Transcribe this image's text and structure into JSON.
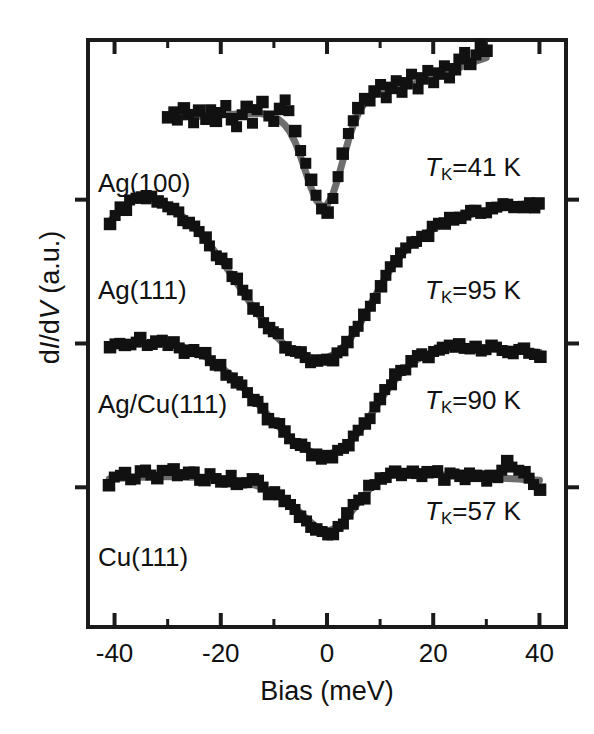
{
  "figure": {
    "background": "#ffffff",
    "frame_color": "#1a1a1a",
    "data_color": "#111111",
    "fit_color": "#6e6e6e"
  },
  "axes": {
    "xlabel": "Bias (meV)",
    "ylabel_prefix": "d",
    "ylabel_I": "I",
    "ylabel_mid": "/d",
    "ylabel_V": "V",
    "ylabel_suffix": " (a.u.)",
    "ylabel_full": "dI/dV (a.u.)",
    "xlim": [
      -45,
      45
    ],
    "ylim": [
      0,
      1
    ],
    "xticks_major": [
      -40,
      -20,
      0,
      20,
      40
    ],
    "xticks_major_labels": [
      "-40",
      "-20",
      "0",
      "20",
      "40"
    ],
    "xticks_minor": [
      -30,
      -10,
      10,
      30
    ],
    "yticks_unlabeled_count": 3,
    "grid": false
  },
  "chart_data": {
    "type": "line",
    "title": "",
    "xlabel": "Bias (meV)",
    "ylabel": "dI/dV (a.u.)",
    "xlim": [
      -45,
      45
    ],
    "ylim": [
      0,
      1
    ],
    "legend_position": "inline-labels",
    "series": [
      {
        "name": "Ag(100)",
        "label": "Ag(100)",
        "kondo_temperature_K": 41,
        "annotation": "TK=41 K",
        "x": [
          -30,
          -29,
          -28,
          -27,
          -26,
          -25,
          -24,
          -23,
          -22,
          -21,
          -20,
          -19,
          -18,
          -17,
          -16,
          -15,
          -14,
          -13,
          -12,
          -11,
          -10,
          -9,
          -8,
          -7,
          -6,
          -5,
          -4,
          -3,
          -2,
          -1,
          0,
          1,
          2,
          3,
          4,
          5,
          6,
          7,
          8,
          9,
          10,
          11,
          12,
          13,
          14,
          15,
          16,
          17,
          18,
          19,
          20,
          21,
          22,
          23,
          24,
          25,
          26,
          27,
          28,
          29,
          30
        ],
        "y_fit": [
          0.868,
          0.868,
          0.868,
          0.869,
          0.869,
          0.87,
          0.87,
          0.871,
          0.871,
          0.872,
          0.872,
          0.873,
          0.873,
          0.874,
          0.874,
          0.875,
          0.875,
          0.875,
          0.874,
          0.872,
          0.869,
          0.864,
          0.856,
          0.844,
          0.826,
          0.802,
          0.775,
          0.748,
          0.727,
          0.716,
          0.719,
          0.735,
          0.762,
          0.795,
          0.828,
          0.856,
          0.877,
          0.892,
          0.902,
          0.908,
          0.912,
          0.914,
          0.916,
          0.918,
          0.92,
          0.922,
          0.924,
          0.927,
          0.93,
          0.933,
          0.936,
          0.939,
          0.943,
          0.946,
          0.95,
          0.953,
          0.957,
          0.96,
          0.964,
          0.967,
          0.97
        ],
        "y_data": [
          0.869,
          0.879,
          0.862,
          0.884,
          0.872,
          0.858,
          0.879,
          0.866,
          0.882,
          0.863,
          0.876,
          0.888,
          0.866,
          0.852,
          0.873,
          0.885,
          0.858,
          0.88,
          0.893,
          0.871,
          0.861,
          0.884,
          0.899,
          0.878,
          0.845,
          0.812,
          0.79,
          0.762,
          0.735,
          0.712,
          0.707,
          0.731,
          0.768,
          0.806,
          0.841,
          0.862,
          0.883,
          0.901,
          0.897,
          0.912,
          0.925,
          0.903,
          0.919,
          0.931,
          0.912,
          0.926,
          0.941,
          0.918,
          0.934,
          0.948,
          0.928,
          0.944,
          0.957,
          0.936,
          0.951,
          0.966,
          0.978,
          0.959,
          0.975,
          0.99,
          0.982
        ]
      },
      {
        "name": "Ag(111)",
        "label": "Ag(111)",
        "kondo_temperature_K": 95,
        "annotation": "TK=95 K",
        "x": [
          -41,
          -40,
          -39,
          -38,
          -37,
          -36,
          -35,
          -34,
          -33,
          -32,
          -31,
          -30,
          -28,
          -26,
          -24,
          -22,
          -20,
          -18,
          -16,
          -14,
          -12,
          -10,
          -8,
          -6,
          -4,
          -2,
          0,
          2,
          4,
          6,
          8,
          10,
          12,
          14,
          16,
          18,
          20,
          22,
          24,
          26,
          28,
          30,
          32,
          34,
          36,
          38,
          40
        ],
        "y_fit": [
          0.69,
          0.7,
          0.71,
          0.718,
          0.724,
          0.728,
          0.73,
          0.731,
          0.73,
          0.728,
          0.724,
          0.719,
          0.706,
          0.69,
          0.671,
          0.65,
          0.626,
          0.6,
          0.573,
          0.546,
          0.521,
          0.499,
          0.481,
          0.468,
          0.46,
          0.457,
          0.459,
          0.468,
          0.486,
          0.513,
          0.546,
          0.58,
          0.61,
          0.634,
          0.653,
          0.667,
          0.678,
          0.687,
          0.694,
          0.7,
          0.705,
          0.709,
          0.713,
          0.716,
          0.719,
          0.722,
          0.724
        ],
        "y_data": [
          0.688,
          0.702,
          0.716,
          0.712,
          0.726,
          0.731,
          0.733,
          0.729,
          0.734,
          0.726,
          0.722,
          0.716,
          0.708,
          0.688,
          0.673,
          0.648,
          0.628,
          0.598,
          0.575,
          0.544,
          0.519,
          0.502,
          0.478,
          0.47,
          0.458,
          0.455,
          0.456,
          0.466,
          0.484,
          0.511,
          0.548,
          0.582,
          0.613,
          0.636,
          0.656,
          0.664,
          0.681,
          0.689,
          0.692,
          0.703,
          0.708,
          0.706,
          0.715,
          0.718,
          0.716,
          0.724,
          0.72
        ]
      },
      {
        "name": "Ag/Cu(111)",
        "label": "Ag/Cu(111)",
        "kondo_temperature_K": 90,
        "annotation": "TK=90 K",
        "x": [
          -41,
          -40,
          -38,
          -36,
          -34,
          -32,
          -30,
          -28,
          -26,
          -24,
          -22,
          -20,
          -18,
          -16,
          -14,
          -12,
          -10,
          -8,
          -6,
          -4,
          -2,
          0,
          2,
          4,
          6,
          8,
          10,
          12,
          14,
          16,
          18,
          20,
          22,
          24,
          26,
          28,
          30,
          32,
          34,
          36,
          38,
          40
        ],
        "y_fit": [
          0.48,
          0.481,
          0.482,
          0.483,
          0.483,
          0.483,
          0.482,
          0.479,
          0.474,
          0.466,
          0.456,
          0.443,
          0.428,
          0.41,
          0.39,
          0.37,
          0.35,
          0.331,
          0.315,
          0.303,
          0.295,
          0.294,
          0.299,
          0.312,
          0.332,
          0.358,
          0.386,
          0.412,
          0.434,
          0.45,
          0.461,
          0.468,
          0.472,
          0.474,
          0.475,
          0.475,
          0.475,
          0.474,
          0.473,
          0.472,
          0.47,
          0.468
        ],
        "y_data": [
          0.478,
          0.483,
          0.48,
          0.486,
          0.481,
          0.485,
          0.48,
          0.477,
          0.472,
          0.468,
          0.454,
          0.445,
          0.426,
          0.412,
          0.388,
          0.372,
          0.348,
          0.333,
          0.313,
          0.305,
          0.293,
          0.292,
          0.301,
          0.31,
          0.334,
          0.356,
          0.388,
          0.414,
          0.436,
          0.452,
          0.464,
          0.47,
          0.474,
          0.478,
          0.473,
          0.477,
          0.472,
          0.476,
          0.47,
          0.474,
          0.466,
          0.462
        ]
      },
      {
        "name": "Cu(111)",
        "label": "Cu(111)",
        "kondo_temperature_K": 57,
        "annotation": "TK=57 K",
        "x": [
          -41,
          -40,
          -38,
          -36,
          -34,
          -32,
          -30,
          -28,
          -26,
          -24,
          -22,
          -20,
          -18,
          -16,
          -14,
          -12,
          -10,
          -8,
          -6,
          -4,
          -2,
          0,
          2,
          4,
          6,
          8,
          10,
          12,
          14,
          16,
          18,
          20,
          22,
          24,
          26,
          28,
          30,
          32,
          34,
          36,
          38,
          40
        ],
        "y_fit": [
          0.252,
          0.253,
          0.254,
          0.255,
          0.255,
          0.256,
          0.256,
          0.256,
          0.255,
          0.255,
          0.254,
          0.252,
          0.25,
          0.247,
          0.243,
          0.237,
          0.229,
          0.218,
          0.203,
          0.186,
          0.17,
          0.163,
          0.17,
          0.189,
          0.213,
          0.235,
          0.25,
          0.258,
          0.261,
          0.262,
          0.261,
          0.26,
          0.259,
          0.258,
          0.257,
          0.256,
          0.255,
          0.254,
          0.253,
          0.252,
          0.251,
          0.25
        ],
        "y_data": [
          0.241,
          0.255,
          0.262,
          0.251,
          0.266,
          0.254,
          0.268,
          0.256,
          0.263,
          0.25,
          0.261,
          0.249,
          0.258,
          0.245,
          0.252,
          0.238,
          0.232,
          0.215,
          0.2,
          0.182,
          0.166,
          0.158,
          0.172,
          0.192,
          0.216,
          0.24,
          0.254,
          0.262,
          0.258,
          0.266,
          0.255,
          0.262,
          0.252,
          0.26,
          0.251,
          0.258,
          0.249,
          0.256,
          0.282,
          0.268,
          0.254,
          0.235
        ]
      }
    ]
  },
  "labels": {
    "curves": [
      {
        "text": "Ag(100)",
        "x": 98,
        "y": 168
      },
      {
        "text": "Ag(111)",
        "x": 98,
        "y": 275
      },
      {
        "text": "Ag/Cu(111)",
        "x": 98,
        "y": 389
      },
      {
        "text": "Cu(111)",
        "x": 98,
        "y": 542
      }
    ],
    "kondo": [
      {
        "t": "T",
        "sub": "K",
        "eq": "=41 K",
        "x": 425,
        "y": 152
      },
      {
        "t": "T",
        "sub": "K",
        "eq": "=95 K",
        "x": 425,
        "y": 275
      },
      {
        "t": "T",
        "sub": "K",
        "eq": "=90 K",
        "x": 425,
        "y": 385
      },
      {
        "t": "T",
        "sub": "K",
        "eq": "=57 K",
        "x": 425,
        "y": 496
      }
    ]
  }
}
